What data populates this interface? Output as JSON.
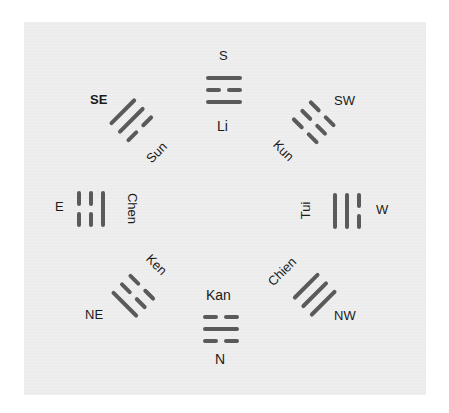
{
  "diagram": {
    "title": "",
    "line_color": "#5a5a5a",
    "background_color": "#ececec",
    "trigrams": [
      {
        "direction": "S",
        "name": "Li",
        "lines_outer_to_inner": [
          "solid",
          "broken",
          "solid"
        ]
      },
      {
        "direction": "SW",
        "name": "Kun",
        "lines_outer_to_inner": [
          "broken",
          "broken",
          "broken"
        ]
      },
      {
        "direction": "W",
        "name": "Tui",
        "lines_outer_to_inner": [
          "broken",
          "solid",
          "solid"
        ]
      },
      {
        "direction": "NW",
        "name": "Chien",
        "lines_outer_to_inner": [
          "solid",
          "solid",
          "solid"
        ]
      },
      {
        "direction": "N",
        "name": "Kan",
        "lines_outer_to_inner": [
          "broken",
          "solid",
          "broken"
        ]
      },
      {
        "direction": "NE",
        "name": "Ken",
        "lines_outer_to_inner": [
          "solid",
          "broken",
          "broken"
        ]
      },
      {
        "direction": "E",
        "name": "Chen",
        "lines_outer_to_inner": [
          "broken",
          "broken",
          "solid"
        ]
      },
      {
        "direction": "SE",
        "name": "Sun",
        "lines_outer_to_inner": [
          "solid",
          "solid",
          "broken"
        ]
      }
    ]
  }
}
